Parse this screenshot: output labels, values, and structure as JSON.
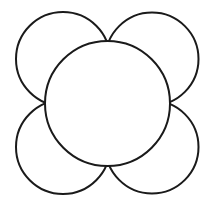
{
  "diagram": {
    "title": "",
    "background": "#ffffff",
    "stroke_color": "#1a1a1a",
    "stroke_width": 2,
    "central_circle": {
      "cx": 107.5,
      "cy": 103.5,
      "r": 62.5,
      "fill": "#ffffff"
    },
    "petals": [
      {
        "name": "top-left",
        "cx": 63,
        "cy": 59,
        "r": 47
      },
      {
        "name": "top-right",
        "cx": 152,
        "cy": 59,
        "r": 46.5
      },
      {
        "name": "bottom-left",
        "cx": 63,
        "cy": 147,
        "r": 47
      },
      {
        "name": "bottom-right",
        "cx": 152,
        "cy": 147,
        "r": 46.5
      }
    ]
  }
}
